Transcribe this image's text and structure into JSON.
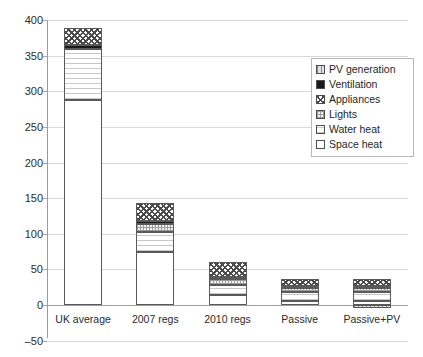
{
  "chart_data": {
    "type": "bar",
    "subtype": "stacked-bar",
    "title": "",
    "xlabel": "",
    "ylabel": "",
    "ylim": [
      -50,
      400
    ],
    "yticks": [
      -50,
      0,
      50,
      100,
      150,
      200,
      250,
      300,
      350,
      400
    ],
    "grid": true,
    "legend_position": "top-right",
    "categories": [
      "UK average",
      "2007 regs",
      "2010 regs",
      "Passive",
      "Passive+PV"
    ],
    "series": [
      {
        "name": "Space heat",
        "values": [
          288,
          75,
          14,
          5,
          5
        ]
      },
      {
        "name": "Water heat",
        "values": [
          72,
          28,
          14,
          13,
          13
        ]
      },
      {
        "name": "Lights",
        "values": [
          0,
          10,
          8,
          6,
          6
        ]
      },
      {
        "name": "Ventilation",
        "values": [
          5,
          5,
          3,
          2,
          2
        ]
      },
      {
        "name": "Appliances",
        "values": [
          24,
          25,
          22,
          11,
          11
        ]
      },
      {
        "name": "PV generation",
        "values": [
          0,
          0,
          0,
          0,
          -4
        ]
      }
    ],
    "totals": [
      389,
      143,
      61,
      37,
      33
    ]
  },
  "legend": {
    "items": [
      {
        "label": "PV generation",
        "pattern": "vertical-lines"
      },
      {
        "label": "Ventilation",
        "pattern": "solid-black"
      },
      {
        "label": "Appliances",
        "pattern": "diagonal-cross-hatch"
      },
      {
        "label": "Lights",
        "pattern": "fine-grid"
      },
      {
        "label": "Water heat",
        "pattern": "horizontal-lines"
      },
      {
        "label": "Space heat",
        "pattern": "white"
      }
    ]
  },
  "axis": {
    "y_labels": [
      "400",
      "350",
      "300",
      "250",
      "200",
      "150",
      "100",
      "50",
      "0",
      "-50"
    ],
    "x_labels": [
      "UK average",
      "2007 regs",
      "2010 regs",
      "Passive",
      "Passive+PV"
    ]
  },
  "colors": {
    "gridline": "#d9d9d9",
    "axis": "#9a9a9a",
    "bar_outline": "#595959",
    "text": "#2b2b2b"
  }
}
